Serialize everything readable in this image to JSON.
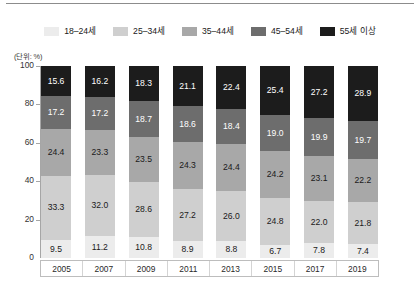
{
  "unit_note": "(단위: %)",
  "legend": {
    "items": [
      {
        "label": "18–24세",
        "color": "#ececec"
      },
      {
        "label": "25–34세",
        "color": "#cfcfcf"
      },
      {
        "label": "35–44세",
        "color": "#a8a8a8"
      },
      {
        "label": "45–54세",
        "color": "#6d6d6d"
      },
      {
        "label": "55세 이상",
        "color": "#1c1c1c"
      }
    ]
  },
  "chart_data": {
    "type": "bar",
    "stacked": true,
    "normalized_percent": true,
    "title": "",
    "subtitle": "",
    "xlabel": "",
    "ylabel": "",
    "unit": "%",
    "unit_note": "(단위: %)",
    "ylim": [
      0,
      100
    ],
    "yticks": [
      0,
      20,
      40,
      60,
      80,
      100
    ],
    "ytick_labels": [
      "0",
      "20",
      "40",
      "60",
      "80",
      "100"
    ],
    "grid": false,
    "legend_position": "top-center",
    "categories": [
      "2005",
      "2007",
      "2009",
      "2011",
      "2013",
      "2015",
      "2017",
      "2019"
    ],
    "series": [
      {
        "name": "18–24세",
        "color": "#ececec",
        "text_color": "#1a1a1a",
        "values": [
          9.5,
          11.2,
          10.8,
          8.9,
          8.8,
          6.7,
          7.8,
          7.4
        ]
      },
      {
        "name": "25–34세",
        "color": "#cfcfcf",
        "text_color": "#1a1a1a",
        "values": [
          33.3,
          32.0,
          28.6,
          27.2,
          26.0,
          24.8,
          22.0,
          21.8
        ]
      },
      {
        "name": "35–44세",
        "color": "#a8a8a8",
        "text_color": "#1a1a1a",
        "values": [
          24.4,
          23.3,
          23.5,
          24.3,
          24.4,
          24.2,
          23.1,
          22.2
        ]
      },
      {
        "name": "45–54세",
        "color": "#6d6d6d",
        "text_color": "#ffffff",
        "values": [
          17.2,
          17.2,
          18.7,
          18.6,
          18.4,
          19.0,
          19.9,
          19.7
        ]
      },
      {
        "name": "55세 이상",
        "color": "#1c1c1c",
        "text_color": "#ffffff",
        "values": [
          15.6,
          16.2,
          18.3,
          21.1,
          22.4,
          25.4,
          27.2,
          28.9
        ]
      }
    ],
    "column_totals": [
      100.0,
      99.9,
      99.9,
      100.1,
      100.0,
      100.1,
      100.0,
      100.0
    ]
  }
}
